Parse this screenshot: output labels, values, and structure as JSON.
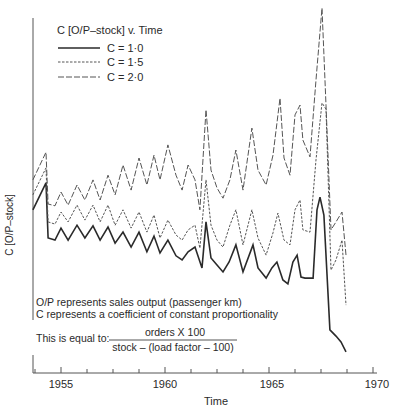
{
  "chart_data": {
    "type": "line",
    "xlabel": "Time",
    "ylabel": "C [O/P-stock]",
    "xlim": [
      1953.65,
      1970
    ],
    "ylim": [
      0,
      100
    ],
    "y_units": "relative (no y-axis tick values shown; estimated on 0-100 scale)",
    "x_ticks": [
      1955,
      1960,
      1965,
      1970
    ],
    "x_minor_tick_step": 1.25,
    "grid": false,
    "legend_position": "top-left",
    "series": [
      {
        "name": "C = 1·0",
        "style": "solid",
        "x": [
          1953.65,
          1954.28,
          1954.38,
          1954.71,
          1955.0,
          1955.34,
          1955.77,
          1956.15,
          1956.54,
          1956.88,
          1957.26,
          1957.6,
          1957.98,
          1958.37,
          1958.75,
          1959.13,
          1959.47,
          1959.76,
          1960.14,
          1960.53,
          1960.82,
          1961.11,
          1961.44,
          1961.78,
          1961.97,
          1962.21,
          1962.5,
          1962.79,
          1963.08,
          1963.41,
          1963.75,
          1964.23,
          1964.47,
          1964.86,
          1965.14,
          1965.38,
          1965.67,
          1965.91,
          1966.15,
          1966.35,
          1966.54,
          1966.73,
          1967.12,
          1967.31,
          1967.45,
          1967.64,
          1967.93,
          1968.22,
          1968.46,
          1968.7
        ],
        "values": [
          44.7,
          52.1,
          37.0,
          36.4,
          39.7,
          36.4,
          40.5,
          37.0,
          40.3,
          36.4,
          40.0,
          35.6,
          38.6,
          34.5,
          38.6,
          33.2,
          37.5,
          32.9,
          36.4,
          32.1,
          31.0,
          33.2,
          34.5,
          28.8,
          41.4,
          31.5,
          29.6,
          27.7,
          30.4,
          35.1,
          27.7,
          35.1,
          28.8,
          26.0,
          28.8,
          30.4,
          25.5,
          24.4,
          30.4,
          32.3,
          26.3,
          26.0,
          26.0,
          44.7,
          48.2,
          43.3,
          11.8,
          10.1,
          8.5,
          5.8
        ]
      },
      {
        "name": "C = 1·5",
        "style": "short-dash",
        "x": [
          1953.65,
          1954.28,
          1954.38,
          1954.71,
          1955.0,
          1955.34,
          1955.77,
          1956.15,
          1956.54,
          1956.88,
          1957.26,
          1957.6,
          1957.98,
          1958.37,
          1958.75,
          1959.13,
          1959.47,
          1959.76,
          1960.14,
          1960.53,
          1960.82,
          1961.11,
          1961.44,
          1961.68,
          1961.97,
          1962.21,
          1962.5,
          1962.79,
          1963.12,
          1963.41,
          1963.75,
          1964.18,
          1964.47,
          1964.86,
          1965.19,
          1965.43,
          1965.72,
          1966.01,
          1966.25,
          1966.49,
          1966.63,
          1966.97,
          1967.26,
          1967.55,
          1967.74,
          1967.98,
          1968.22,
          1968.51,
          1968.7
        ],
        "values": [
          48.8,
          56.2,
          41.4,
          40.8,
          44.1,
          41.4,
          46.0,
          41.9,
          46.0,
          41.4,
          46.0,
          40.5,
          44.7,
          39.7,
          44.1,
          38.6,
          43.3,
          37.0,
          41.9,
          37.8,
          36.4,
          39.2,
          40.5,
          34.2,
          52.9,
          40.5,
          36.4,
          34.5,
          40.5,
          44.7,
          35.1,
          44.7,
          37.0,
          32.3,
          38.4,
          43.8,
          36.4,
          35.1,
          44.7,
          47.4,
          39.2,
          38.6,
          58.4,
          74.0,
          72.3,
          28.2,
          31.0,
          36.4,
          18.6
        ]
      },
      {
        "name": "C = 2·0",
        "style": "long-dash",
        "x": [
          1953.65,
          1954.28,
          1954.38,
          1954.71,
          1955.0,
          1955.34,
          1955.77,
          1956.15,
          1956.54,
          1956.88,
          1957.26,
          1957.6,
          1957.98,
          1958.37,
          1958.75,
          1959.13,
          1959.47,
          1959.76,
          1960.14,
          1960.53,
          1960.82,
          1961.11,
          1961.44,
          1961.68,
          1961.97,
          1962.21,
          1962.5,
          1962.79,
          1963.12,
          1963.41,
          1963.75,
          1964.18,
          1964.47,
          1964.86,
          1965.19,
          1965.53,
          1965.72,
          1966.01,
          1966.25,
          1966.49,
          1966.63,
          1966.97,
          1967.26,
          1967.55,
          1967.74,
          1967.98,
          1968.22,
          1968.51,
          1968.7
        ],
        "values": [
          52.9,
          60.5,
          46.3,
          45.8,
          49.6,
          46.0,
          51.5,
          47.4,
          52.9,
          47.4,
          54.2,
          48.8,
          57.0,
          50.1,
          58.9,
          51.5,
          59.7,
          52.9,
          62.5,
          54.2,
          50.1,
          57.0,
          52.9,
          44.7,
          72.1,
          55.6,
          50.7,
          47.9,
          52.9,
          61.1,
          50.1,
          67.1,
          55.6,
          51.5,
          59.7,
          75.3,
          58.9,
          54.2,
          70.7,
          73.4,
          63.8,
          59.2,
          80.3,
          100.0,
          73.4,
          39.2,
          41.4,
          44.1,
          32.3
        ]
      }
    ],
    "annotations": [
      "O/P represents sales output (passenger km)",
      "C represents a coefficient of constant proportionality"
    ],
    "formula": {
      "prefix": "This is equal to:",
      "numerator": "orders X 100",
      "denominator": "stock – (load factor – 100)"
    }
  },
  "legend": {
    "title": "C [O/P–stock] v. Time",
    "items": [
      "C = 1·0",
      "C = 1·5",
      "C = 2·0"
    ]
  },
  "axes": {
    "x_title": "Time",
    "y_title": "C [O/P–stock]",
    "x_tick_labels": [
      "1955",
      "1960",
      "1965",
      "1970"
    ]
  },
  "colors": {
    "ink": "#2a2a2a",
    "dash_ink": "#555555",
    "background": "#ffffff"
  }
}
